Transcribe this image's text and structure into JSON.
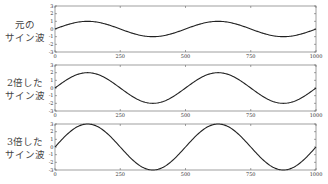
{
  "chart_data": [
    {
      "type": "line",
      "title": "",
      "row_label": [
        "元の",
        "サイン波"
      ],
      "xlabel": "",
      "ylabel": "",
      "xlim": [
        0,
        1000
      ],
      "ylim": [
        -3,
        3
      ],
      "xticks": [
        0,
        250,
        500,
        750,
        1000
      ],
      "xtick_labels": [
        "0",
        "250",
        "500",
        "750",
        "1000"
      ],
      "yticks": [
        -3,
        -2,
        -1,
        0,
        1,
        2,
        3
      ],
      "ytick_labels": [
        "-3",
        "-2",
        "-1",
        "0",
        "1",
        "2",
        "3"
      ],
      "series": [
        {
          "name": "元のサイン波",
          "amplitude": 1,
          "period": 500,
          "x_range": [
            0,
            1000
          ],
          "formula": "1*sin(2*pi*x/500)"
        }
      ],
      "grid": false,
      "line_color": "#222222"
    },
    {
      "type": "line",
      "title": "",
      "row_label": [
        "2倍した",
        "サイン波"
      ],
      "xlabel": "",
      "ylabel": "",
      "xlim": [
        0,
        1000
      ],
      "ylim": [
        -3,
        3
      ],
      "xticks": [
        0,
        250,
        500,
        750,
        1000
      ],
      "xtick_labels": [
        "0",
        "250",
        "500",
        "750",
        "1000"
      ],
      "yticks": [
        -3,
        -2,
        -1,
        0,
        1,
        2,
        3
      ],
      "ytick_labels": [
        "-3",
        "-2",
        "-1",
        "0",
        "1",
        "2",
        "3"
      ],
      "series": [
        {
          "name": "2倍したサイン波",
          "amplitude": 2,
          "period": 500,
          "x_range": [
            0,
            1000
          ],
          "formula": "2*sin(2*pi*x/500)"
        }
      ],
      "grid": false,
      "line_color": "#222222"
    },
    {
      "type": "line",
      "title": "",
      "row_label": [
        "3倍した",
        "サイン波"
      ],
      "xlabel": "",
      "ylabel": "",
      "xlim": [
        0,
        1000
      ],
      "ylim": [
        -3,
        3
      ],
      "xticks": [
        0,
        250,
        500,
        750,
        1000
      ],
      "xtick_labels": [
        "0",
        "250",
        "500",
        "750",
        "1000"
      ],
      "yticks": [
        -3,
        -2,
        -1,
        0,
        1,
        2,
        3
      ],
      "ytick_labels": [
        "-3",
        "-2",
        "-1",
        "0",
        "1",
        "2",
        "3"
      ],
      "series": [
        {
          "name": "3倍したサイン波",
          "amplitude": 3,
          "period": 500,
          "x_range": [
            0,
            1000
          ],
          "formula": "3*sin(2*pi*x/500)"
        }
      ],
      "grid": false,
      "line_color": "#222222"
    }
  ]
}
